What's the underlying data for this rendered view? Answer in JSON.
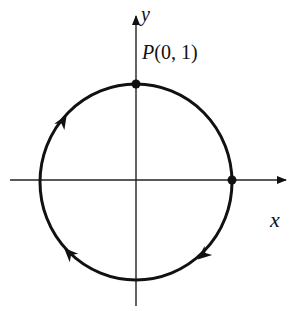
{
  "diagram": {
    "type": "unit-circle-orientation",
    "axes": {
      "x_label": "x",
      "y_label": "y"
    },
    "point": {
      "name": "P",
      "coords": "(0, 1)",
      "label": "P(0, 1)"
    },
    "orientation": "counterclockwise",
    "arrow_count": 3,
    "colors": {
      "stroke": "#111111",
      "background": "#ffffff"
    }
  }
}
